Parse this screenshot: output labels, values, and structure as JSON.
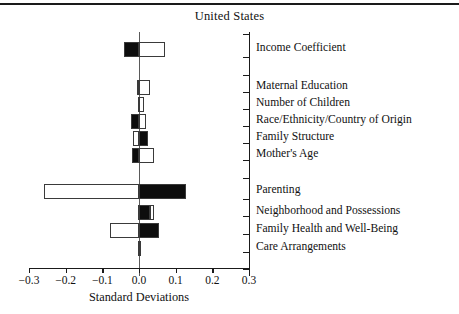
{
  "chart_title": "United States",
  "axis": {
    "x_label": "Standard Deviations",
    "x_ticks": [
      "−0.3",
      "−0.2",
      "−0.1",
      "0.0",
      "0.1",
      "0.2",
      "0.3"
    ],
    "x_tick_values": [
      -0.3,
      -0.2,
      -0.1,
      0.0,
      0.1,
      0.2,
      0.3
    ],
    "xlim": [
      -0.3,
      0.3
    ]
  },
  "chart_data": {
    "type": "bar",
    "orientation": "horizontal",
    "title": "United States",
    "xlabel": "Standard Deviations",
    "ylabel": "",
    "xlim": [
      -0.3,
      0.3
    ],
    "grid": false,
    "legend": null,
    "categories": [
      "Income Coefficient",
      "Maternal Education",
      "Number of Children",
      "Race/Ethnicity/Country of Origin",
      "Family Structure",
      "Mother's Age",
      "Parenting",
      "Neighborhood and Possessions",
      "Family Health and Well-Being",
      "Care Arrangements"
    ],
    "series": [
      {
        "name": "negative-side bar",
        "values": [
          -0.041,
          -0.005,
          -0.004,
          -0.022,
          -0.015,
          -0.02,
          -0.259,
          -0.002,
          -0.08,
          -0.003
        ]
      },
      {
        "name": "positive-side bar",
        "values": [
          0.071,
          0.03,
          0.014,
          0.018,
          0.025,
          0.04,
          0.129,
          0.04,
          0.055,
          0.004
        ]
      }
    ],
    "bars": [
      {
        "label": "Income Coefficient",
        "neg": -0.041,
        "neg_fill": "black",
        "pos": 0.071,
        "pos_fill": "white"
      },
      {
        "label": "Maternal Education",
        "neg": -0.005,
        "neg_fill": "black",
        "pos": 0.03,
        "pos_fill": "white"
      },
      {
        "label": "Number of Children",
        "neg": -0.004,
        "neg_fill": "black",
        "pos": 0.014,
        "pos_fill": "white"
      },
      {
        "label": "Race/Ethnicity/Country of Origin",
        "neg": -0.022,
        "neg_fill": "black",
        "pos": 0.018,
        "pos_fill": "white"
      },
      {
        "label": "Family Structure",
        "neg": -0.015,
        "neg_fill": "white",
        "pos": 0.025,
        "pos_fill": "black"
      },
      {
        "label": "Mother's Age",
        "neg": -0.02,
        "neg_fill": "black",
        "pos": 0.04,
        "pos_fill": "white"
      },
      {
        "label": "Parenting",
        "neg": -0.259,
        "neg_fill": "white",
        "pos": 0.129,
        "pos_fill": "black"
      },
      {
        "label": "Neighborhood and Possessions",
        "neg": -0.002,
        "neg_fill": "black",
        "pos": 0.04,
        "pos_fill": "mixed-black-then-white"
      },
      {
        "label": "Family Health and Well-Being",
        "neg": -0.08,
        "neg_fill": "white",
        "pos": 0.055,
        "pos_fill": "black"
      },
      {
        "label": "Care Arrangements",
        "neg": -0.003,
        "neg_fill": "white",
        "pos": 0.004,
        "pos_fill": "white"
      }
    ]
  },
  "colors": {
    "bar_black": "#0d0d0d",
    "bar_white": "#ffffff",
    "bar_outline": "#3a3a3a",
    "axis": "#1a1a1a",
    "zero_line": "#5a5a5a"
  }
}
